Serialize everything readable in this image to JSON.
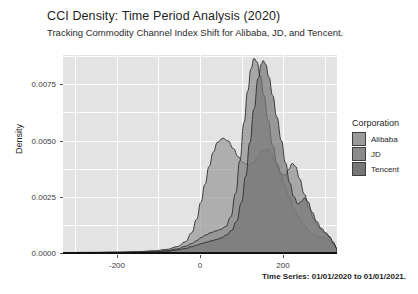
{
  "chart_data": {
    "type": "area",
    "title": "CCI Density: Time Period Analysis (2020)",
    "subtitle": "Tracking Commodity Channel Index Shift for Alibaba, JD, and Tencent.",
    "caption": "Time Series: 01/01/2020 to 01/01/2021.",
    "xlabel": "",
    "ylabel": "Density",
    "xlim": [
      -330,
      330
    ],
    "ylim": [
      0,
      0.0088
    ],
    "xticks": [
      -200,
      0,
      200
    ],
    "xtick_labels": [
      "-200",
      "0",
      "200"
    ],
    "yticks": [
      0.0,
      0.0025,
      0.005,
      0.0075
    ],
    "ytick_labels": [
      "0.0000",
      "0.0025",
      "0.0050",
      "0.0075"
    ],
    "grid": true,
    "legend_position": "right",
    "legend_title": "Corporation",
    "panel_background": "#e3e3e3",
    "gridline_color": "#ffffff",
    "series": [
      {
        "name": "Alibaba",
        "color": "#9a9a9a",
        "fill_opacity": 0.72,
        "peak_x": 55,
        "peak_y": 0.0051,
        "points": [
          [
            -330,
            2e-05
          ],
          [
            -260,
            3e-05
          ],
          [
            -200,
            4e-05
          ],
          [
            -150,
            6e-05
          ],
          [
            -110,
            0.0001
          ],
          [
            -80,
            0.00016
          ],
          [
            -55,
            0.00028
          ],
          [
            -35,
            0.0005
          ],
          [
            -20,
            0.0009
          ],
          [
            -8,
            0.0015
          ],
          [
            2,
            0.00225
          ],
          [
            12,
            0.00305
          ],
          [
            22,
            0.00385
          ],
          [
            32,
            0.00448
          ],
          [
            42,
            0.00492
          ],
          [
            55,
            0.0051
          ],
          [
            68,
            0.00498
          ],
          [
            80,
            0.00465
          ],
          [
            92,
            0.00428
          ],
          [
            104,
            0.00402
          ],
          [
            116,
            0.00392
          ],
          [
            128,
            0.00402
          ],
          [
            140,
            0.00428
          ],
          [
            152,
            0.00455
          ],
          [
            163,
            0.00462
          ],
          [
            172,
            0.0044
          ],
          [
            182,
            0.004
          ],
          [
            193,
            0.00352
          ],
          [
            204,
            0.003
          ],
          [
            215,
            0.00248
          ],
          [
            226,
            0.002
          ],
          [
            238,
            0.0016
          ],
          [
            250,
            0.00125
          ],
          [
            262,
            0.00098
          ],
          [
            274,
            0.0008
          ],
          [
            286,
            0.00072
          ],
          [
            297,
            0.0007
          ],
          [
            308,
            0.00062
          ],
          [
            318,
            0.00042
          ],
          [
            330,
            0.0002
          ]
        ]
      },
      {
        "name": "JD",
        "color": "#8b8b8b",
        "fill_opacity": 0.68,
        "peak_x": 130,
        "peak_y": 0.00865,
        "points": [
          [
            -330,
            1e-05
          ],
          [
            -260,
            2e-05
          ],
          [
            -200,
            3e-05
          ],
          [
            -150,
            4e-05
          ],
          [
            -110,
            6e-05
          ],
          [
            -80,
            0.0001
          ],
          [
            -55,
            0.00018
          ],
          [
            -35,
            0.0003
          ],
          [
            -20,
            0.00042
          ],
          [
            -8,
            0.00055
          ],
          [
            2,
            0.00068
          ],
          [
            14,
            0.0008
          ],
          [
            26,
            0.0009
          ],
          [
            38,
            0.00098
          ],
          [
            50,
            0.00105
          ],
          [
            62,
            0.00118
          ],
          [
            74,
            0.0016
          ],
          [
            86,
            0.00265
          ],
          [
            96,
            0.0041
          ],
          [
            106,
            0.0058
          ],
          [
            115,
            0.0072
          ],
          [
            123,
            0.0082
          ],
          [
            130,
            0.00865
          ],
          [
            137,
            0.0085
          ],
          [
            145,
            0.0079
          ],
          [
            154,
            0.007
          ],
          [
            164,
            0.0059
          ],
          [
            175,
            0.00478
          ],
          [
            186,
            0.00395
          ],
          [
            196,
            0.00352
          ],
          [
            205,
            0.00345
          ],
          [
            214,
            0.00372
          ],
          [
            222,
            0.00398
          ],
          [
            230,
            0.00385
          ],
          [
            240,
            0.0033
          ],
          [
            251,
            0.00262
          ],
          [
            263,
            0.00198
          ],
          [
            275,
            0.00148
          ],
          [
            287,
            0.00112
          ],
          [
            299,
            0.0009
          ],
          [
            310,
            0.00076
          ],
          [
            320,
            0.0005
          ],
          [
            330,
            0.00022
          ]
        ]
      },
      {
        "name": "Tencent",
        "color": "#767676",
        "fill_opacity": 0.7,
        "peak_x": 152,
        "peak_y": 0.00855,
        "points": [
          [
            -330,
            1e-05
          ],
          [
            -260,
            2e-05
          ],
          [
            -200,
            2e-05
          ],
          [
            -150,
            3e-05
          ],
          [
            -110,
            5e-05
          ],
          [
            -80,
            8e-05
          ],
          [
            -55,
            0.00013
          ],
          [
            -35,
            0.0002
          ],
          [
            -20,
            0.00028
          ],
          [
            -8,
            0.00035
          ],
          [
            4,
            0.00042
          ],
          [
            16,
            0.00048
          ],
          [
            28,
            0.00054
          ],
          [
            40,
            0.0006
          ],
          [
            52,
            0.00068
          ],
          [
            64,
            0.0008
          ],
          [
            76,
            0.001
          ],
          [
            88,
            0.0014
          ],
          [
            100,
            0.00225
          ],
          [
            110,
            0.0034
          ],
          [
            120,
            0.0049
          ],
          [
            130,
            0.0064
          ],
          [
            140,
            0.00775
          ],
          [
            148,
            0.0084
          ],
          [
            152,
            0.00855
          ],
          [
            158,
            0.0084
          ],
          [
            166,
            0.00782
          ],
          [
            175,
            0.007
          ],
          [
            185,
            0.00605
          ],
          [
            196,
            0.005
          ],
          [
            206,
            0.004
          ],
          [
            216,
            0.00312
          ],
          [
            226,
            0.0025
          ],
          [
            236,
            0.00218
          ],
          [
            245,
            0.0023
          ],
          [
            252,
            0.00245
          ],
          [
            260,
            0.00228
          ],
          [
            270,
            0.00182
          ],
          [
            281,
            0.0014
          ],
          [
            292,
            0.0011
          ],
          [
            303,
            0.0009
          ],
          [
            313,
            0.0007
          ],
          [
            322,
            0.00042
          ],
          [
            330,
            0.00018
          ]
        ]
      }
    ]
  }
}
